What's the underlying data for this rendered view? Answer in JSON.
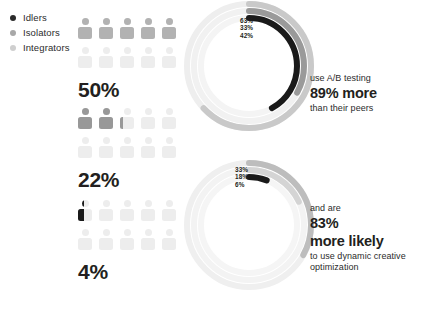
{
  "legend": {
    "items": [
      {
        "label": "Idlers",
        "color": "#2b2b2b"
      },
      {
        "label": "Isolators",
        "color": "#a8a8a8"
      },
      {
        "label": "Integrators",
        "color": "#cfcfcf"
      }
    ]
  },
  "pictograms": [
    {
      "name": "idlers-group",
      "percent_label": "50%",
      "percent_value": 50,
      "filled": 5.0,
      "total": 10,
      "fill_color": "#b2b2b2",
      "empty_color": "#ededed"
    },
    {
      "name": "isolators-group",
      "percent_label": "22%",
      "percent_value": 22,
      "filled": 2.2,
      "total": 10,
      "fill_color": "#989898",
      "empty_color": "#ededed"
    },
    {
      "name": "integrators-group",
      "percent_label": "4%",
      "percent_value": 4,
      "filled": 0.4,
      "total": 10,
      "fill_color": "#1a1a1a",
      "empty_color": "#ededed"
    }
  ],
  "donuts": [
    {
      "name": "ab-testing-donut",
      "labels": [
        "63%",
        "33%",
        "42%"
      ],
      "rings": [
        {
          "label": "63%",
          "value": 63,
          "color": "#c9c9c9",
          "track": "#eeeeee"
        },
        {
          "label": "33%",
          "value": 33,
          "color": "#9a9a9a",
          "track": "#f1f1f1"
        },
        {
          "label": "42%",
          "value": 42,
          "color": "#1a1a1a",
          "track": "#f4f4f4"
        }
      ]
    },
    {
      "name": "dynamic-creative-donut",
      "labels": [
        "33%",
        "18%",
        "6%"
      ],
      "rings": [
        {
          "label": "33%",
          "value": 33,
          "color": "#bdbdbd",
          "track": "#efefef"
        },
        {
          "label": "18%",
          "value": 18,
          "color": "#d4d4d4",
          "track": "#f3f3f3"
        },
        {
          "label": "6%",
          "value": 6,
          "color": "#1a1a1a",
          "track": "#f5f5f5"
        }
      ]
    }
  ],
  "callouts": [
    {
      "name": "ab-testing-callout",
      "line1": "use A/B testing",
      "line2": "89% more",
      "line3": "than their peers",
      "line4": ""
    },
    {
      "name": "dynamic-creative-callout",
      "line1": "and are",
      "line2": "83%",
      "line3": "more likely",
      "line4": "to use dynamic creative optimization"
    }
  ],
  "chart_data": {
    "type": "pie",
    "title": "",
    "pictogram_series": {
      "categories": [
        "Idlers",
        "Isolators",
        "Integrators"
      ],
      "values": [
        50,
        22,
        4
      ],
      "unit": "%",
      "icons_total": 10
    },
    "donut_charts": [
      {
        "name": "ab-testing-donut",
        "rings": [
          63,
          33,
          42
        ],
        "ring_labels": [
          "63%",
          "33%",
          "42%"
        ],
        "ylim": [
          0,
          100
        ]
      },
      {
        "name": "dynamic-creative-donut",
        "rings": [
          33,
          18,
          6
        ],
        "ring_labels": [
          "33%",
          "18%",
          "6%"
        ],
        "ylim": [
          0,
          100
        ]
      }
    ]
  }
}
